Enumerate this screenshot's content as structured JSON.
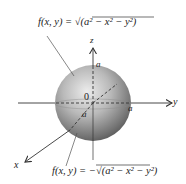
{
  "diagram": {
    "top_equation": {
      "lhs": "f(x, y) = ",
      "radical": "a",
      "rest": "2 − x2 − y2",
      "full": "f(x, y) = √(a² − x² − y²)"
    },
    "bottom_equation": {
      "full": "f(x, y) = −√(a² − x² − y²)"
    },
    "axes": {
      "x": "x",
      "y": "y",
      "z": "z"
    },
    "origin_label": "0",
    "radius_labels": [
      "a",
      "a",
      "a"
    ],
    "colors": {
      "sphere_light": "#e4e4e4",
      "sphere_dark": "#5e5e5e",
      "axis": "#333333",
      "text": "#222222"
    }
  }
}
